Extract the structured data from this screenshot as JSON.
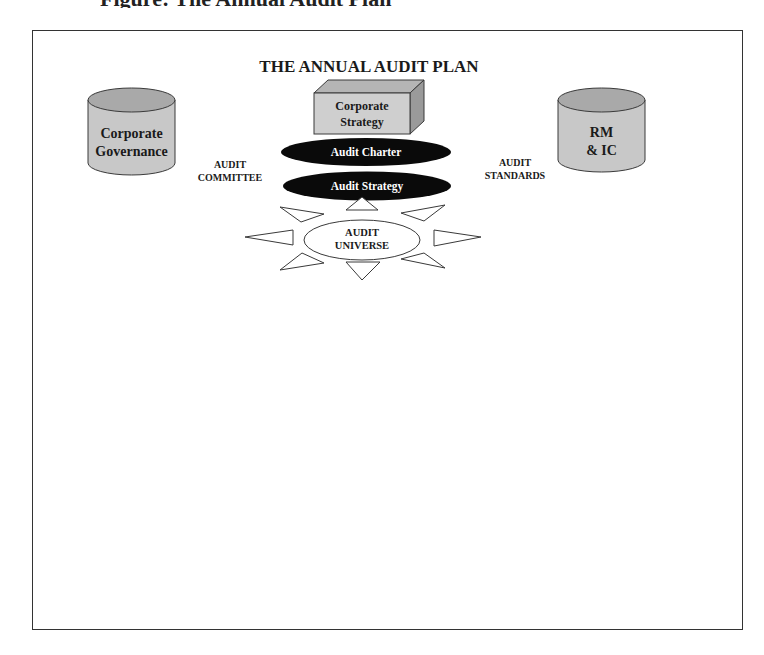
{
  "page": {
    "caption_clipped": "Figure: The Annual Audit Plan"
  },
  "diagram": {
    "title": "THE ANNUAL AUDIT PLAN",
    "corporate_strategy": {
      "line1": "Corporate",
      "line2": "Strategy"
    },
    "corporate_governance": {
      "line1": "Corporate",
      "line2": "Governance"
    },
    "rm_ic": {
      "line1": "RM",
      "line2": "& IC"
    },
    "audit_charter": "Audit Charter",
    "audit_strategy": "Audit Strategy",
    "audit_committee": {
      "line1": "AUDIT",
      "line2": "COMMITTEE"
    },
    "audit_standards": {
      "line1": "AUDIT",
      "line2": "STANDARDS"
    },
    "audit_universe": {
      "line1": "AUDIT",
      "line2": "UNIVERSE"
    }
  },
  "colors": {
    "cylinder_body": "#c8c8c8",
    "cylinder_top": "#a9a9a9",
    "box_front": "#cfcfcf",
    "box_top": "#b5b5b5",
    "box_side": "#9a9a9a",
    "ellipse_dark": "#0a0a0a",
    "outline": "#3a3a3a"
  }
}
